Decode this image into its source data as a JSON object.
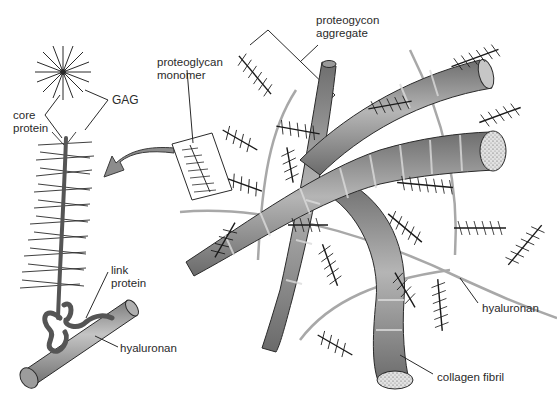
{
  "figure": {
    "labels": {
      "gag": "GAG",
      "core_protein": "core\nprotein",
      "link_protein": "link\nprotein",
      "hyaluronan_left": "hyaluronan",
      "proteoglycan_monomer": "proteoglycan\nmonomer",
      "proteoglycan_aggregate": "proteogycon\naggregate",
      "hyaluronan_right": "hyaluronan",
      "collagen_fibril": "collagen fibril"
    },
    "colors": {
      "line": "#2a2a2a",
      "fibril_fill": "#9a9a9a",
      "fibril_dark": "#6b6b6b",
      "fibril_end": "#d8d8d8",
      "hyaluronan_strand": "#a8a8a8",
      "arrow": "#8c8c8c",
      "link_protein": "#555555"
    }
  }
}
